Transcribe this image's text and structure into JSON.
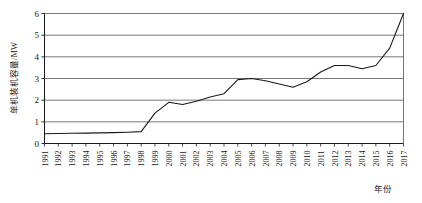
{
  "chart_data": {
    "type": "line",
    "title": "",
    "xlabel": "年份",
    "ylabel": "单机装机容量/MW",
    "xlim": [
      1991,
      2017
    ],
    "ylim": [
      0,
      6
    ],
    "yticks": [
      0,
      1,
      2,
      3,
      4,
      5,
      6
    ],
    "grid": true,
    "legend": false,
    "categories": [
      "1991",
      "1992",
      "1993",
      "1994",
      "1995",
      "1996",
      "1997",
      "1998",
      "1999",
      "2000",
      "2001",
      "2002",
      "2003",
      "2004",
      "2005",
      "2006",
      "2007",
      "2008",
      "2009",
      "2010",
      "2011",
      "2012",
      "2013",
      "2014",
      "2015",
      "2016",
      "2017"
    ],
    "values": [
      0.45,
      0.46,
      0.47,
      0.48,
      0.49,
      0.5,
      0.52,
      0.55,
      1.4,
      1.9,
      1.8,
      1.95,
      2.15,
      2.3,
      2.95,
      3.0,
      2.9,
      2.75,
      2.6,
      2.85,
      3.3,
      3.6,
      3.6,
      3.45,
      3.6,
      4.4,
      6.0
    ],
    "series_name": "单机装机容量"
  }
}
